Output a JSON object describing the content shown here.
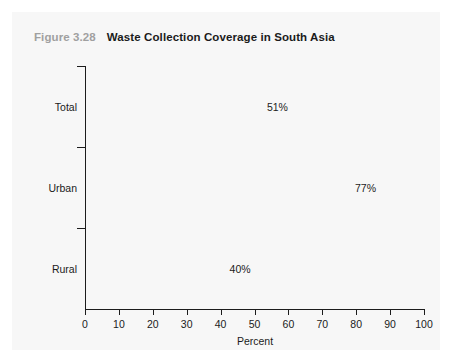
{
  "figure": {
    "number": "Figure 3.28",
    "title": "Waste Collection Coverage in South Asia"
  },
  "chart_data": {
    "type": "bar",
    "orientation": "horizontal",
    "title": "Waste Collection Coverage in South Asia",
    "categories": [
      "Total",
      "Urban",
      "Rural"
    ],
    "values": [
      51,
      77,
      40
    ],
    "value_labels": [
      "51%",
      "77%",
      "40%"
    ],
    "xlabel": "Percent",
    "ylabel": "",
    "xlim": [
      0,
      100
    ],
    "xticks": [
      0,
      10,
      20,
      30,
      40,
      50,
      60,
      70,
      80,
      90,
      100
    ],
    "xtick_labels": [
      "0",
      "10",
      "20",
      "30",
      "40",
      "50",
      "60",
      "70",
      "80",
      "90",
      "100"
    ],
    "grid": false,
    "legend": false,
    "series": [
      {
        "name": "Waste collection coverage",
        "values": [
          51,
          77,
          40
        ],
        "color": "#c7c7c7"
      }
    ]
  },
  "colors": {
    "bar": "#c7c7c7",
    "axis": "#1c1c1c",
    "text": "#1b1b1b",
    "figure_number": "#a0a0a0",
    "panel_background": "#f7f7f7"
  }
}
